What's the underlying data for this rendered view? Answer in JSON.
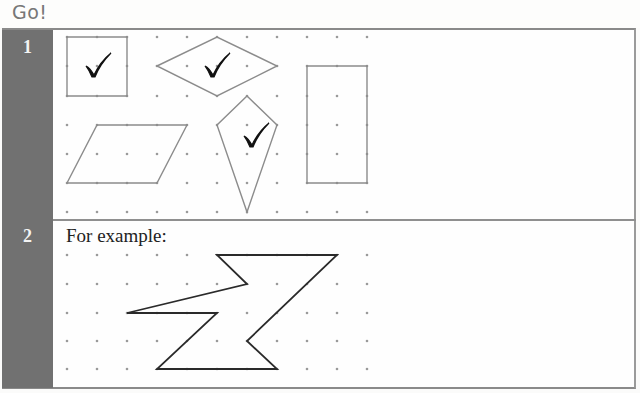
{
  "header": {
    "title": "Go!"
  },
  "exercises": [
    {
      "number": "1",
      "grid": {
        "origin_x": 67,
        "origin_y": 37,
        "step_x": 30,
        "rows_y": [
          37,
          66,
          96,
          125,
          154,
          183,
          212
        ],
        "cols": 11
      },
      "shapes": [
        {
          "name": "square",
          "points": "67,37 127,37 127,96 67,96",
          "checked": true,
          "check_at": [
            98,
            66
          ]
        },
        {
          "name": "rhombus",
          "points": "157,66 217,37 277,66 217,96",
          "checked": true,
          "check_at": [
            217,
            66
          ]
        },
        {
          "name": "rectangle",
          "points": "307,66 367,66 367,183 307,183",
          "checked": false
        },
        {
          "name": "parallelogram",
          "points": "97,125 187,125 157,183 67,183",
          "checked": false
        },
        {
          "name": "kite",
          "points": "247,96 277,125 247,212 217,125",
          "checked": true,
          "check_at": [
            256,
            136
          ]
        }
      ]
    },
    {
      "number": "2",
      "label": "For example:",
      "grid": {
        "origin_x": 67,
        "step_x": 30,
        "rows_y": [
          255,
          284,
          313,
          341,
          369
        ],
        "cols": 11
      },
      "shapes": [
        {
          "name": "z-shape",
          "points": "217,255 337,255 247,341 277,369 157,369 217,313 127,313 247,284"
        }
      ]
    }
  ],
  "colors": {
    "sidebar": "#717171",
    "shape_stroke_row1": "#8c8c8c",
    "shape_stroke_row2": "#2a2a2a",
    "dot": "#9a9a9a",
    "check": "#111111"
  },
  "icons": {
    "check": "check-mark-icon"
  }
}
